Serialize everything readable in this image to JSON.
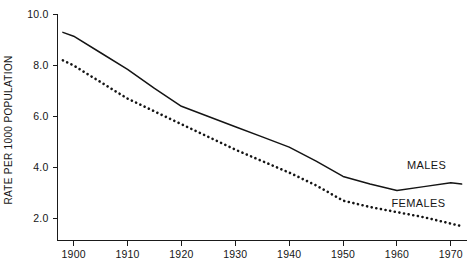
{
  "chart_data": {
    "type": "line",
    "title": "",
    "xlabel": "",
    "ylabel": "RATE PER 1000 POPULATION",
    "xlim": [
      1897,
      1973
    ],
    "ylim": [
      1.4,
      10.4
    ],
    "grid": false,
    "legend_position": "inline-right",
    "x_ticks": [
      1900,
      1910,
      1920,
      1930,
      1940,
      1950,
      1960,
      1970
    ],
    "x_tick_labels": [
      "1900",
      "1910",
      "1920",
      "1930",
      "1940",
      "1950",
      "1960",
      "1970"
    ],
    "y_ticks": [
      2.0,
      4.0,
      6.0,
      8.0,
      10.0
    ],
    "y_tick_labels": [
      "2.0",
      "4.0",
      "6.0",
      "8.0",
      "10.0"
    ],
    "x": [
      1898,
      1900,
      1905,
      1910,
      1915,
      1920,
      1925,
      1930,
      1935,
      1940,
      1945,
      1950,
      1955,
      1960,
      1965,
      1970,
      1972
    ],
    "series": [
      {
        "name": "MALES",
        "style": "solid",
        "label": "MALES",
        "values": [
          9.3,
          9.15,
          8.5,
          7.85,
          7.1,
          6.4,
          6.0,
          5.6,
          5.2,
          4.8,
          4.25,
          3.65,
          3.35,
          3.1,
          3.25,
          3.4,
          3.35
        ]
      },
      {
        "name": "FEMALES",
        "style": "dotted",
        "label": "FEMALES",
        "values": [
          8.2,
          8.0,
          7.35,
          6.7,
          6.2,
          5.7,
          5.2,
          4.7,
          4.25,
          3.8,
          3.3,
          2.7,
          2.45,
          2.25,
          2.05,
          1.8,
          1.7
        ]
      }
    ],
    "annotations": [
      {
        "text": "MALES",
        "x": 1965.5,
        "y": 3.95
      },
      {
        "text": "FEMALES",
        "x": 1964.0,
        "y": 2.45
      }
    ],
    "colors": {
      "ink": "#141414",
      "background": "#ffffff"
    }
  }
}
